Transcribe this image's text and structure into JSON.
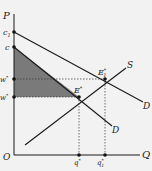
{
  "diagram": {
    "type": "supply-demand",
    "axes": {
      "y_label": "P",
      "x_label": "Q",
      "origin_label": "O"
    },
    "y_ticks": [
      {
        "label": "c",
        "sub": "1",
        "sup": "",
        "y": 32
      },
      {
        "label": "c",
        "sub": "",
        "sup": "",
        "y": 47
      },
      {
        "label": "w",
        "sub": "1",
        "sup": "*",
        "y": 79
      },
      {
        "label": "w",
        "sub": "",
        "sup": "*",
        "y": 97
      }
    ],
    "x_ticks": [
      {
        "label": "q",
        "sub": "",
        "sup": "*",
        "x": 79
      },
      {
        "label": "q",
        "sub": "1",
        "sup": "*",
        "x": 105
      }
    ],
    "curves": [
      {
        "name": "D",
        "label": "D",
        "description": "demand curve (upper, D1)"
      },
      {
        "name": "D",
        "label": "D",
        "description": "demand curve (lower)"
      },
      {
        "name": "S",
        "label": "S",
        "description": "supply curve"
      }
    ],
    "points": [
      {
        "label": "E",
        "sub": "",
        "sup": "*"
      },
      {
        "label": "E",
        "sub": "1",
        "sup": "*"
      }
    ],
    "shaded_region": "consumer surplus triangle between c, w* and E*",
    "colors": {
      "background": "#f2f2f2",
      "line": "#1a1a1a",
      "shade": "#7a7a7a",
      "dotted": "#333333"
    }
  },
  "labels": {
    "P": "P",
    "Q": "Q",
    "O": "O",
    "c1_main": "c",
    "c1_sub": "1",
    "c_main": "c",
    "w1_main": "w",
    "w1_sub": "1",
    "w1_sup": "*",
    "w_main": "w",
    "w_sup": "*",
    "q_main": "q",
    "q_sup": "*",
    "q1_main": "q",
    "q1_sub": "1",
    "q1_sup": "*",
    "E_main": "E",
    "E_sup": "*",
    "E1_main": "E",
    "E1_sub": "1",
    "E1_sup": "*",
    "S": "S",
    "D_upper": "D",
    "D_lower": "D"
  }
}
